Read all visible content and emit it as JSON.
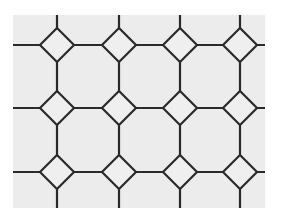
{
  "image": {
    "subject": "octagon-and-dot tile floor pattern",
    "description": "Black and white photograph of light octagonal tiles with small diamond-shaped dot tiles at intersections, separated by dark grout lines",
    "colors": {
      "tile": "#ececec",
      "grout": "#2a2a2a",
      "background": "#ffffff"
    },
    "diamond_centers_x": [
      57,
      119,
      180,
      240
    ],
    "diamond_centers_y": [
      45,
      108,
      172
    ]
  }
}
